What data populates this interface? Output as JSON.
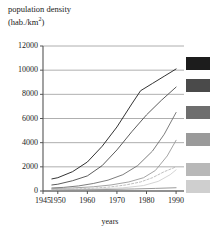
{
  "chart_data": {
    "type": "line",
    "title_line1": "population density",
    "title_line2_prefix": "(hab./km",
    "title_line2_sup": "2",
    "title_line2_suffix": ")",
    "xlabel": "years",
    "ylabel": "population density (hab./km2)",
    "xlim": [
      1945,
      1992
    ],
    "ylim": [
      0,
      12000
    ],
    "xticks": [
      1945,
      1950,
      1960,
      1970,
      1980,
      1990
    ],
    "xtick_labels": [
      "1945",
      "1950",
      "1960",
      "1970",
      "1980",
      "1990"
    ],
    "yticks": [
      0,
      2000,
      4000,
      6000,
      8000,
      10000,
      12000
    ],
    "ytick_labels": [
      "0",
      "2000",
      "4000",
      "6000",
      "8000",
      "10000",
      "12000"
    ],
    "grid": "horizontal",
    "legend": "right-swatches",
    "series": [
      {
        "name": "series-1",
        "color": "#1c1c1c",
        "style": "solid",
        "swatch_y": 57,
        "x": [
          1948,
          1950,
          1955,
          1960,
          1965,
          1970,
          1975,
          1978,
          1982,
          1986,
          1990
        ],
        "values": [
          1000,
          1100,
          1600,
          2400,
          3700,
          5300,
          7200,
          8300,
          8900,
          9500,
          10100
        ]
      },
      {
        "name": "series-2",
        "color": "#4a4a4a",
        "style": "solid",
        "swatch_y": 79,
        "x": [
          1948,
          1950,
          1955,
          1960,
          1965,
          1970,
          1975,
          1980,
          1985,
          1990
        ],
        "values": [
          500,
          560,
          850,
          1250,
          2100,
          3400,
          4900,
          6300,
          7500,
          8600
        ]
      },
      {
        "name": "series-3",
        "color": "#6e6e6e",
        "style": "solid",
        "swatch_y": 106,
        "x": [
          1948,
          1952,
          1957,
          1962,
          1967,
          1972,
          1977,
          1982,
          1986,
          1990
        ],
        "values": [
          250,
          300,
          420,
          620,
          900,
          1350,
          2100,
          3300,
          4700,
          6500
        ]
      },
      {
        "name": "series-4",
        "color": "#9a9a9a",
        "style": "solid",
        "swatch_y": 133,
        "x": [
          1948,
          1955,
          1962,
          1968,
          1974,
          1979,
          1983,
          1987,
          1990
        ],
        "values": [
          200,
          250,
          350,
          500,
          750,
          1100,
          1700,
          2900,
          4200
        ]
      },
      {
        "name": "series-5",
        "color": "#b8b8b8",
        "style": "dashed",
        "swatch_y": 163,
        "x": [
          1948,
          1955,
          1962,
          1968,
          1973,
          1978,
          1982,
          1986,
          1990
        ],
        "values": [
          120,
          160,
          230,
          340,
          500,
          750,
          1100,
          1600,
          2000
        ]
      },
      {
        "name": "series-6",
        "color": "#cfcfcf",
        "style": "solid",
        "swatch_y": 180,
        "x": [
          1948,
          1956,
          1964,
          1972,
          1979,
          1984,
          1988,
          1990
        ],
        "values": [
          100,
          130,
          180,
          260,
          450,
          800,
          1350,
          1750
        ]
      },
      {
        "name": "series-7",
        "color": "#8f8f8f",
        "style": "solid",
        "swatch_y": -1,
        "x": [
          1948,
          1958,
          1968,
          1976,
          1983,
          1990
        ],
        "values": [
          60,
          90,
          130,
          170,
          215,
          270
        ]
      }
    ]
  },
  "geometry": {
    "plot_left": 43,
    "plot_right": 182,
    "plot_top": 46,
    "plot_bottom": 191,
    "x_min": 1945,
    "x_max": 1992,
    "y_min": 0,
    "y_max": 12000,
    "swatch_left": 186,
    "swatch_width": 24,
    "swatch_height": 13
  },
  "colors": {
    "axis": "#555555",
    "grid": "#9b9b9b",
    "text": "#1a1a1a",
    "background": "#ffffff"
  }
}
